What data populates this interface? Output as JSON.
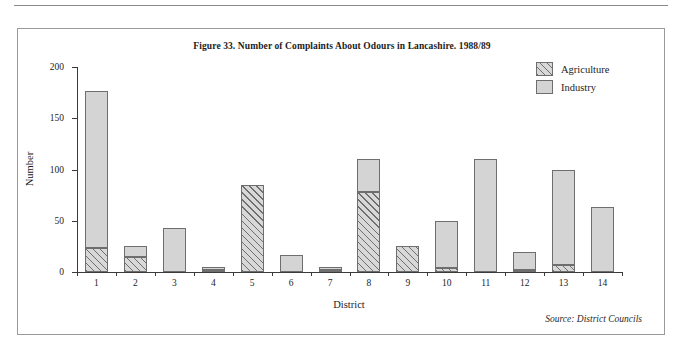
{
  "figure": {
    "title": "Figure 33.  Number of Complaints About Odours in Lancashire. 1988/89",
    "source": "Source: District Councils"
  },
  "legend": {
    "items": [
      {
        "label": "Agriculture",
        "swatch": "hatched-swatch",
        "color": "#d8d8d8"
      },
      {
        "label": "Industry",
        "swatch": "solid-swatch",
        "color": "#d4d4d4"
      }
    ]
  },
  "chart_data": {
    "type": "bar",
    "stacked": true,
    "title": "Figure 33.  Number of Complaints About Odours in Lancashire. 1988/89",
    "xlabel": "District",
    "ylabel": "Number",
    "categories": [
      "1",
      "2",
      "3",
      "4",
      "5",
      "6",
      "7",
      "8",
      "9",
      "10",
      "11",
      "12",
      "13",
      "14"
    ],
    "series": [
      {
        "name": "Agriculture",
        "values": [
          23,
          15,
          0,
          2,
          85,
          0,
          2,
          78,
          25,
          4,
          0,
          2,
          7,
          0
        ]
      },
      {
        "name": "Industry",
        "values": [
          154,
          10,
          43,
          3,
          0,
          17,
          3,
          32,
          0,
          46,
          110,
          18,
          93,
          63
        ]
      }
    ],
    "totals": [
      177,
      25,
      43,
      5,
      85,
      17,
      5,
      110,
      25,
      50,
      110,
      20,
      100,
      63
    ],
    "ylim": [
      0,
      200
    ],
    "yticks": [
      0,
      50,
      100,
      150,
      200
    ],
    "ytick_labels": [
      "0",
      "50",
      "100",
      "150",
      "200"
    ],
    "grid": false,
    "legend_position": "top-right"
  }
}
